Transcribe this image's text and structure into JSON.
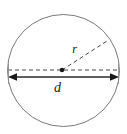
{
  "figure": {
    "kind": "geometry-diagram",
    "background_color": "#ffffff",
    "stroke_color": "#6e6e6e",
    "line_color": "#3a3a3a",
    "label_color": "#1a1a1a",
    "width": 127,
    "height": 134
  },
  "circle": {
    "name": "circle-outline",
    "center_x": 63.5,
    "center_y": 70.5,
    "radius_x": 56.5,
    "radius_y": 56.5,
    "stroke_width": 1
  },
  "center_point": {
    "name": "center-dot",
    "x": 62,
    "y": 70,
    "radius": 2.2
  },
  "dashed_horizontal": {
    "name": "dashed-center-line",
    "x1": 8,
    "y1": 70,
    "x2": 119,
    "y2": 70,
    "dash": "4 3"
  },
  "radius_line": {
    "name": "dashed-radius-line",
    "x1": 62,
    "y1": 70,
    "x2": 107,
    "y2": 41,
    "dash": "4 3"
  },
  "diameter_line": {
    "name": "diameter-arrow-line",
    "x1": 9,
    "y1": 77,
    "x2": 118,
    "y2": 77,
    "arrowheads": "both"
  },
  "labels": {
    "radius": "r",
    "diameter": "d"
  }
}
